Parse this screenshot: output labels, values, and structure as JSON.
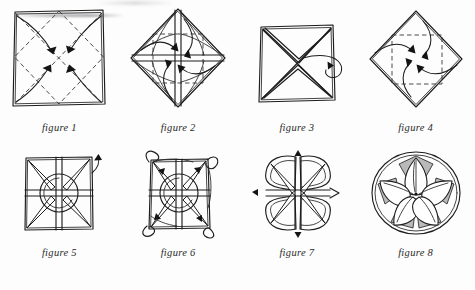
{
  "document": {
    "type": "origami-instruction-diagram",
    "subject": "folded paper flower / lotus",
    "background_color": "#fdfdfd",
    "ink_color": "#1d1d1d",
    "shade_color": "#b9b9b9",
    "step_count": 8
  },
  "figures": [
    {
      "id": "figure-1",
      "caption": "figure 1",
      "shape": "square",
      "creases": "dashed diagonals forming inscribed diamond",
      "arrows": 4,
      "arrow_direction": "corners folded inward to center"
    },
    {
      "id": "figure-2",
      "caption": "figure 2",
      "shape": "diamond",
      "creases": "dashed inner square with center cross",
      "arrows": 4,
      "arrow_direction": "flaps folded inward to center"
    },
    {
      "id": "figure-3",
      "caption": "figure 3",
      "shape": "square",
      "creases": "solid X across both diagonals",
      "arrows": 1,
      "arrow_direction": "turn the model over"
    },
    {
      "id": "figure-4",
      "caption": "figure 4",
      "shape": "diamond",
      "creases": "dashed inner square",
      "arrows": 4,
      "arrow_direction": "corners folded inward to center"
    },
    {
      "id": "figure-5",
      "caption": "figure 5",
      "shape": "square with central circle and four spokes",
      "creases": "quadrant dividing lines",
      "arrows": 1,
      "arrow_direction": "pull out corner flap"
    },
    {
      "id": "figure-6",
      "caption": "figure 6",
      "shape": "square with curled corner petals and central circle",
      "creases": "quadrant dividing lines with diagonal spokes",
      "arrows": 4,
      "arrow_direction": "pull each corner flap outward"
    },
    {
      "id": "figure-7",
      "caption": "figure 7",
      "shape": "four-petal clover with eight radiating spokes",
      "creases": "petal fold lines",
      "arrows": 3,
      "arrow_direction": "shape and round the petals"
    },
    {
      "id": "figure-8",
      "caption": "figure 8",
      "shape": "finished round flower with five veined petals",
      "creases": "petal center veins",
      "arrows": 0,
      "arrow_direction": "completed model"
    }
  ]
}
